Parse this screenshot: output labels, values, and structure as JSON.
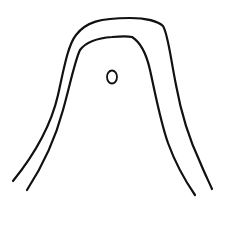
{
  "drawing": {
    "description": "Hand-drawn line sketch of two nested arch shapes with a small circle",
    "background": "#ffffff",
    "stroke_color": "#111111",
    "outer_arch": {
      "stroke_width": 2.2,
      "path": "M13,181 C30,160 50,130 58,95 C64,68 68,45 76,35 C86,22 100,18 130,18 C145,18 158,21 163,26 C168,34 170,55 176,85 C182,118 192,145 200,162 C204,172 209,182 212,189"
    },
    "inner_arch": {
      "stroke_width": 2.2,
      "path": "M27,190 C40,170 55,140 63,110 C70,85 75,60 80,50 C86,42 98,38 112,37 C122,36 128,36 132,37 C140,42 146,52 150,70 C155,92 160,120 168,143 C176,165 186,182 195,195"
    },
    "circle": {
      "cx": 112,
      "cy": 77,
      "rx": 5,
      "ry": 6.5,
      "stroke_width": 1.8
    }
  }
}
